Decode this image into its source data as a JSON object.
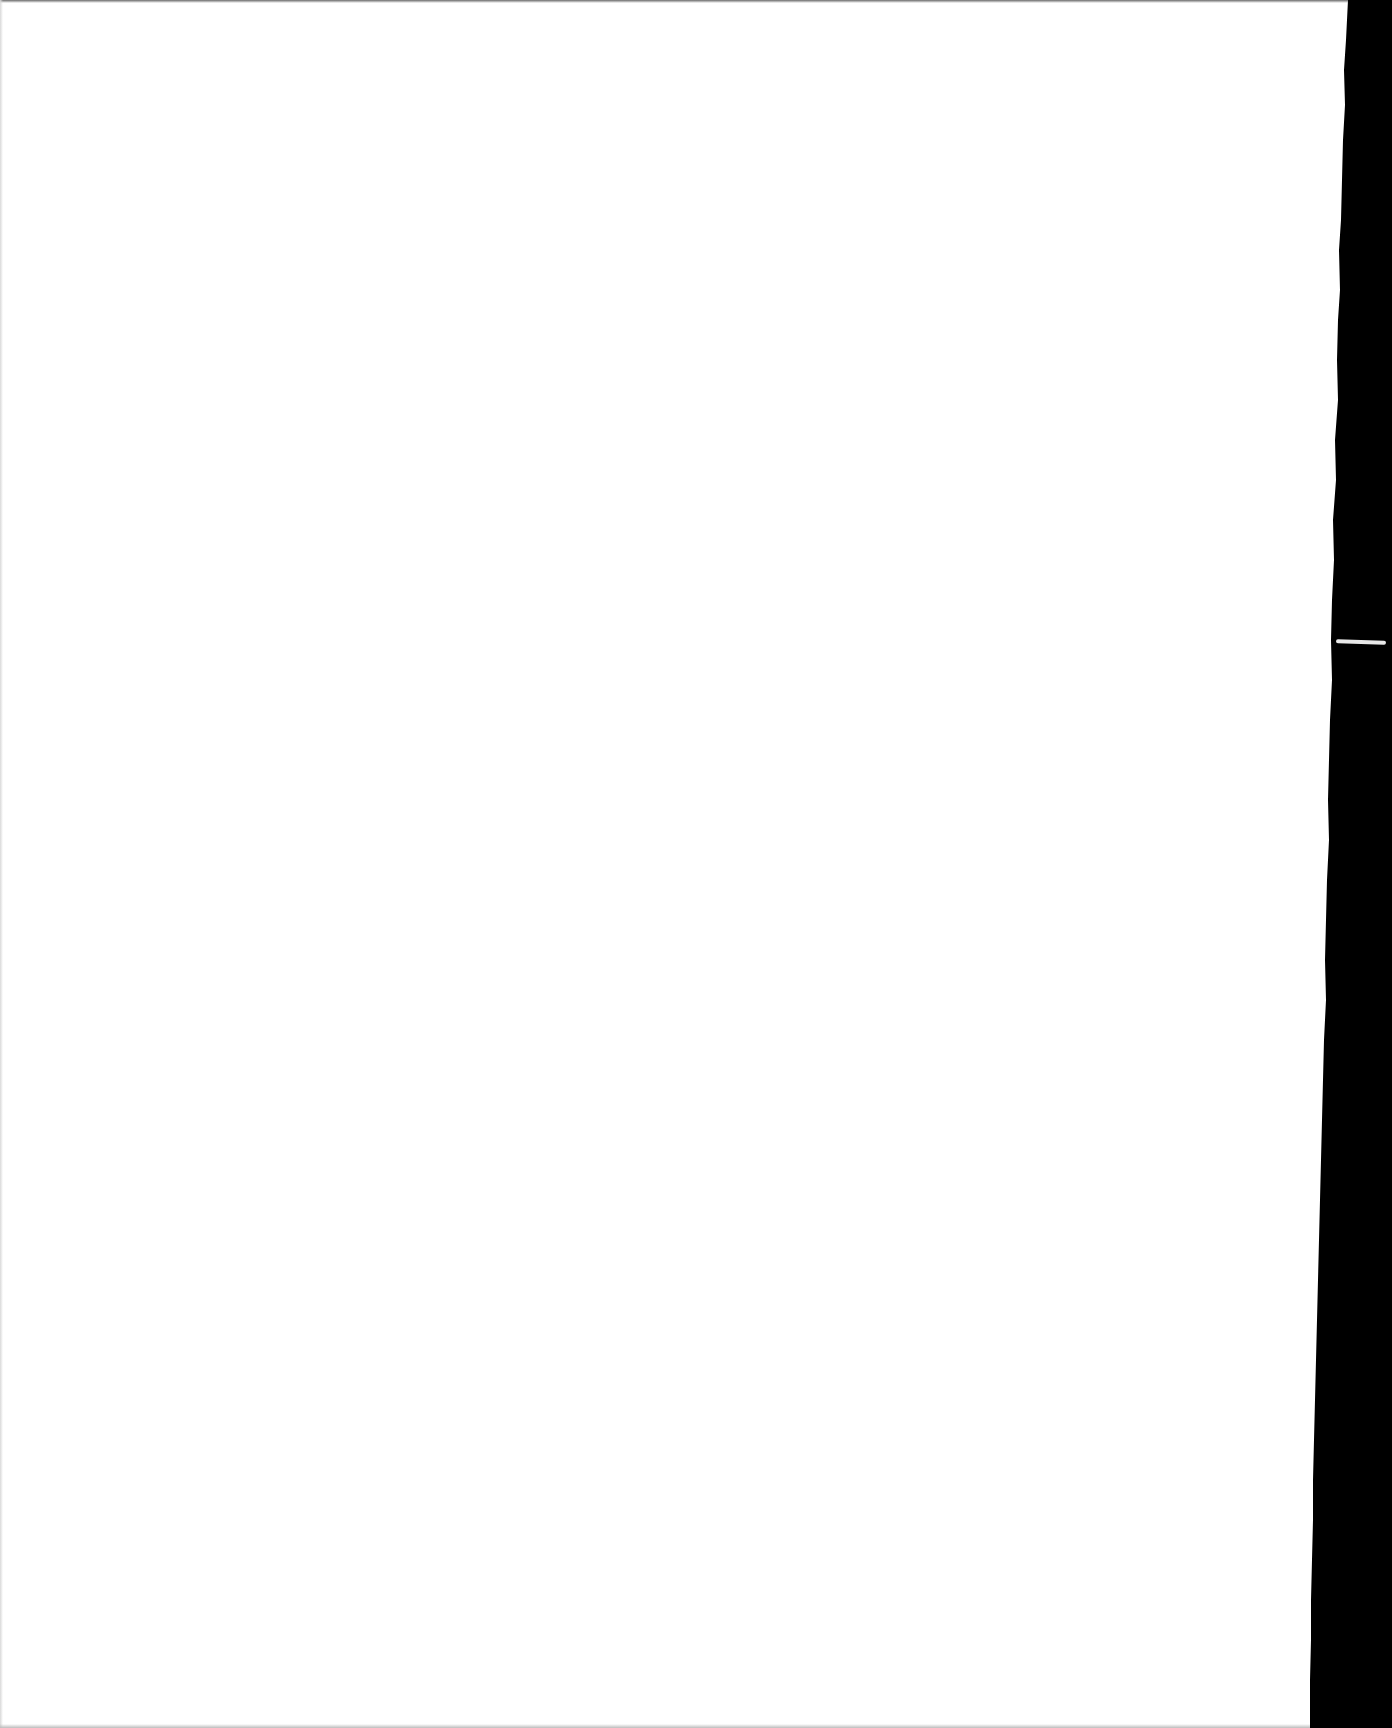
{
  "document": {
    "type": "scanned-page",
    "content_text": "",
    "blank": true
  },
  "colors": {
    "page": "#ffffff",
    "background": "#000000"
  }
}
